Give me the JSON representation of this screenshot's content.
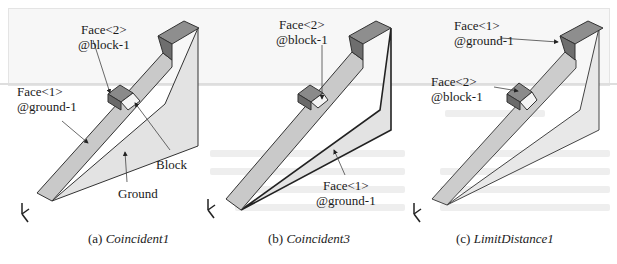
{
  "figure": {
    "panels": [
      {
        "id": "a",
        "caption_prefix": "(a)",
        "caption_name": "Coincident1",
        "labels": {
          "face2_line1": "Face<2>",
          "face2_line2": "@block-1",
          "face1_line1": "Face<1>",
          "face1_line2": "@ground-1",
          "block": "Block",
          "ground": "Ground"
        }
      },
      {
        "id": "b",
        "caption_prefix": "(b)",
        "caption_name": "Coincident3",
        "labels": {
          "face2_line1": "Face<2>",
          "face2_line2": "@block-1",
          "face1_line1": "Face<1>",
          "face1_line2": "@ground-1"
        }
      },
      {
        "id": "c",
        "caption_prefix": "(c)",
        "caption_name": "LimitDistance1",
        "labels": {
          "face1_line1": "Face<1>",
          "face1_line2": "@ground-1",
          "face2_line1": "Face<2>",
          "face2_line2": "@block-1"
        }
      }
    ],
    "colors": {
      "ramp_top": "#c8c8c8",
      "ground_side": "#e2e2e2",
      "block_dark": "#7a7a7a",
      "block_mid": "#9a9a9a",
      "edge": "#333333"
    }
  }
}
